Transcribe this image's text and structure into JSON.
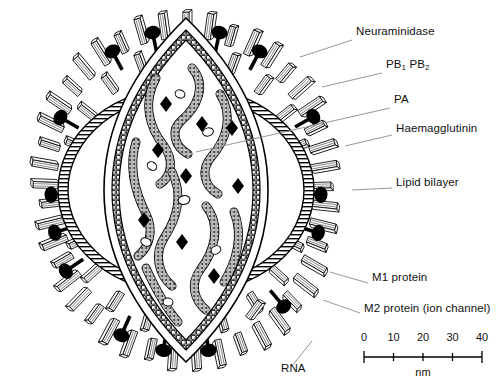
{
  "figure": {
    "background_color": "#ffffff",
    "ink_color": "#000000",
    "leader_line_color": "#8a8a8a"
  },
  "labels": [
    {
      "id": "neuraminidase",
      "text": "Neuraminidase",
      "x": 356,
      "y": 31,
      "leader": {
        "x1": 352,
        "y1": 40,
        "x2": 300,
        "y2": 57
      }
    },
    {
      "id": "pb1-pb2",
      "text": "PB",
      "sub1": "1",
      "text2": " PB",
      "sub2": "2",
      "x": 386,
      "y": 64,
      "leader": {
        "x1": 382,
        "y1": 73,
        "x2": 322,
        "y2": 87
      }
    },
    {
      "id": "pa",
      "text": "PA",
      "x": 394,
      "y": 99,
      "leader": {
        "x1": 390,
        "y1": 108,
        "x2": 196,
        "y2": 152
      }
    },
    {
      "id": "haemagglutinin",
      "text": "Haemagglutinin",
      "x": 396,
      "y": 128,
      "leader": {
        "x1": 392,
        "y1": 135,
        "x2": 345,
        "y2": 146
      }
    },
    {
      "id": "lipid-bilayer",
      "text": "Lipid bilayer",
      "x": 396,
      "y": 182,
      "leader": {
        "x1": 392,
        "y1": 188,
        "x2": 352,
        "y2": 190
      }
    },
    {
      "id": "m1-protein",
      "text": "M1 protein",
      "x": 372,
      "y": 277,
      "leader": {
        "x1": 368,
        "y1": 283,
        "x2": 330,
        "y2": 272
      }
    },
    {
      "id": "m2-protein",
      "text": "M2 protein (ion channel)",
      "x": 364,
      "y": 308,
      "leader": {
        "x1": 360,
        "y1": 313,
        "x2": 323,
        "y2": 300
      }
    },
    {
      "id": "rna",
      "text": "RNA",
      "x": 281,
      "y": 368,
      "leader": {
        "x1": 292,
        "y1": 366,
        "x2": 312,
        "y2": 341
      }
    }
  ],
  "scale_bar": {
    "unit": "nm",
    "ticks": [
      "0",
      "10",
      "20",
      "30",
      "40"
    ],
    "x_start": 364,
    "x_end": 482,
    "y_axis": 357,
    "y_numbers": 338,
    "y_unit": 374
  }
}
